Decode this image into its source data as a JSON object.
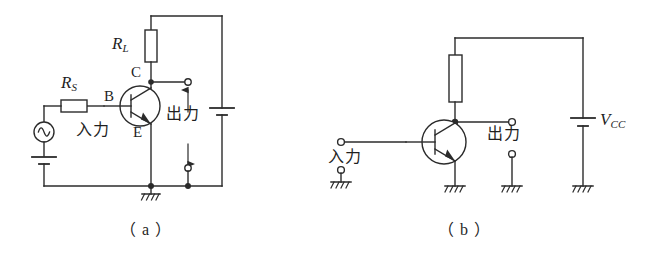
{
  "figure": {
    "type": "circuit-diagram",
    "stroke_color": "#2b2b2b",
    "background_color": "#ffffff"
  },
  "circuit_a": {
    "caption": "（ a ）",
    "labels": {
      "load_resistor": "R",
      "load_resistor_sub": "L",
      "source_resistor": "R",
      "source_resistor_sub": "S",
      "collector": "C",
      "base": "B",
      "emitter": "E",
      "input": "入力",
      "output": "出力"
    },
    "components": [
      {
        "name": "load-resistor",
        "label": "R_L",
        "kind": "resistor"
      },
      {
        "name": "source-resistor",
        "label": "R_S",
        "kind": "resistor"
      },
      {
        "name": "ac-source",
        "label": "",
        "kind": "ac-source"
      },
      {
        "name": "bias-battery",
        "label": "",
        "kind": "battery"
      },
      {
        "name": "supply-battery",
        "label": "",
        "kind": "battery"
      },
      {
        "name": "transistor",
        "label": "",
        "kind": "npn-transistor"
      },
      {
        "name": "ground",
        "label": "",
        "kind": "ground"
      },
      {
        "name": "output-terminal-top",
        "label": "",
        "kind": "terminal"
      },
      {
        "name": "output-terminal-bottom",
        "label": "",
        "kind": "terminal"
      }
    ]
  },
  "circuit_b": {
    "caption": "（ b ）",
    "labels": {
      "supply": "V",
      "supply_sub": "CC",
      "input": "入力",
      "output": "出力"
    },
    "components": [
      {
        "name": "load-resistor",
        "label": "",
        "kind": "resistor"
      },
      {
        "name": "supply-battery",
        "label": "V_CC",
        "kind": "battery"
      },
      {
        "name": "transistor",
        "label": "",
        "kind": "npn-transistor"
      },
      {
        "name": "input-terminal-top",
        "label": "",
        "kind": "terminal"
      },
      {
        "name": "input-terminal-bottom",
        "label": "",
        "kind": "terminal"
      },
      {
        "name": "output-terminal-top",
        "label": "",
        "kind": "terminal"
      },
      {
        "name": "output-terminal-bottom",
        "label": "",
        "kind": "terminal"
      },
      {
        "name": "ground-input",
        "label": "",
        "kind": "ground"
      },
      {
        "name": "ground-emitter",
        "label": "",
        "kind": "ground"
      },
      {
        "name": "ground-output",
        "label": "",
        "kind": "ground"
      },
      {
        "name": "ground-supply",
        "label": "",
        "kind": "ground"
      }
    ]
  }
}
